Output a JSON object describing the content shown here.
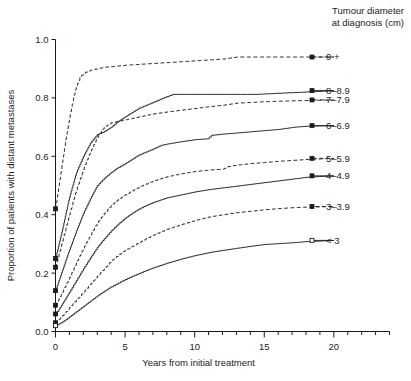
{
  "chart_data": {
    "type": "line",
    "title": "",
    "xlabel": "Years from initial treatment",
    "ylabel": "Proportion of patients with distant metastases",
    "xlim": [
      0,
      24
    ],
    "ylim": [
      0.0,
      1.0
    ],
    "grid": false,
    "legend_position": "right",
    "legend_title": "Tumour diameter at diagnosis (cm)",
    "legend_title_line1": "Tumour diameter",
    "legend_title_line2": "at diagnosis (cm)",
    "x_ticks": [
      0,
      5,
      10,
      15,
      20
    ],
    "x_tick_labels": [
      "0",
      "5",
      "10",
      "15",
      "20"
    ],
    "x_minor_tick_step": 1,
    "y_ticks": [
      0.0,
      0.2,
      0.4,
      0.6,
      0.8,
      1.0
    ],
    "y_tick_labels": [
      "0.0",
      "0.2",
      "0.4",
      "0.6",
      "0.8",
      "1.0"
    ],
    "series": [
      {
        "name": "9 +",
        "label": "9 +",
        "style": "dashed",
        "marker": "filled-square",
        "start_value": 0.42,
        "end_value": 0.94,
        "x": [
          0,
          0.25,
          0.5,
          0.75,
          1.0,
          1.25,
          1.5,
          1.75,
          2.0,
          2.5,
          3.0,
          3.5,
          4.0,
          5.0,
          6.0,
          7.0,
          8.0,
          9.0,
          10.0,
          11.0,
          12.0,
          13.0,
          15.0,
          17.0,
          20.0
        ],
        "values": [
          0.42,
          0.5,
          0.58,
          0.66,
          0.73,
          0.79,
          0.84,
          0.87,
          0.885,
          0.895,
          0.9,
          0.905,
          0.907,
          0.912,
          0.915,
          0.918,
          0.921,
          0.924,
          0.927,
          0.93,
          0.933,
          0.94,
          0.94,
          0.94,
          0.94
        ]
      },
      {
        "name": "8-8.9",
        "label": "8–8.9",
        "style": "solid",
        "marker": "filled-square",
        "start_value": 0.25,
        "end_value": 0.825,
        "x": [
          0,
          0.25,
          0.5,
          0.75,
          1.0,
          1.5,
          2.0,
          2.5,
          3.0,
          3.5,
          4.0,
          4.5,
          5.0,
          5.5,
          6.0,
          6.5,
          7.0,
          7.5,
          8.0,
          8.4,
          14.2,
          20.0
        ],
        "values": [
          0.25,
          0.3,
          0.35,
          0.405,
          0.46,
          0.545,
          0.6,
          0.645,
          0.675,
          0.685,
          0.7,
          0.72,
          0.735,
          0.75,
          0.765,
          0.775,
          0.785,
          0.795,
          0.805,
          0.812,
          0.812,
          0.825
        ]
      },
      {
        "name": "7-7.9",
        "label": "7–7.9",
        "style": "dashed",
        "marker": "filled-square",
        "start_value": 0.22,
        "end_value": 0.793,
        "x": [
          0,
          0.25,
          0.5,
          0.75,
          1.0,
          1.5,
          2.0,
          2.5,
          3.0,
          3.5,
          4.0,
          5.0,
          6.0,
          7.0,
          8.0,
          9.0,
          10.0,
          11.0,
          12.0,
          13.0,
          15.0,
          17.0,
          20.0
        ],
        "values": [
          0.22,
          0.265,
          0.31,
          0.355,
          0.4,
          0.485,
          0.555,
          0.615,
          0.665,
          0.7,
          0.715,
          0.725,
          0.735,
          0.745,
          0.752,
          0.758,
          0.764,
          0.77,
          0.775,
          0.782,
          0.787,
          0.79,
          0.793
        ]
      },
      {
        "name": "6-6.9",
        "label": "6–6.9",
        "style": "solid",
        "marker": "filled-square",
        "start_value": 0.14,
        "end_value": 0.705,
        "x": [
          0,
          0.25,
          0.5,
          0.75,
          1.0,
          1.5,
          2.0,
          2.5,
          3.0,
          3.5,
          4.0,
          4.5,
          5.0,
          5.5,
          6.0,
          6.5,
          7.0,
          7.6,
          8.0,
          9.0,
          10.0,
          10.9,
          11.2,
          12.0,
          13.0,
          14.0,
          15.0,
          16.0,
          17.2,
          18.0,
          20.0
        ],
        "values": [
          0.14,
          0.175,
          0.21,
          0.245,
          0.28,
          0.345,
          0.405,
          0.455,
          0.5,
          0.525,
          0.545,
          0.562,
          0.575,
          0.59,
          0.605,
          0.615,
          0.625,
          0.638,
          0.642,
          0.65,
          0.657,
          0.66,
          0.672,
          0.676,
          0.68,
          0.684,
          0.688,
          0.692,
          0.7,
          0.703,
          0.705
        ]
      },
      {
        "name": "5-5.9",
        "label": "5–5.9",
        "style": "dashed",
        "marker": "filled-square",
        "start_value": 0.09,
        "end_value": 0.593,
        "x": [
          0,
          0.25,
          0.5,
          0.75,
          1.0,
          1.5,
          2.0,
          2.5,
          3.0,
          3.5,
          4.0,
          4.5,
          5.0,
          5.5,
          6.0,
          6.5,
          7.0,
          8.0,
          9.0,
          10.0,
          11.0,
          12.0,
          12.4,
          13.0,
          14.0,
          15.0,
          16.0,
          17.0,
          18.0,
          19.0,
          20.0
        ],
        "values": [
          0.09,
          0.112,
          0.135,
          0.16,
          0.185,
          0.235,
          0.285,
          0.33,
          0.372,
          0.405,
          0.432,
          0.452,
          0.468,
          0.482,
          0.495,
          0.505,
          0.515,
          0.53,
          0.54,
          0.548,
          0.553,
          0.556,
          0.565,
          0.57,
          0.575,
          0.579,
          0.583,
          0.586,
          0.589,
          0.591,
          0.593
        ]
      },
      {
        "name": "4-4.9",
        "label": "4–4.9",
        "style": "solid",
        "marker": "filled-square",
        "start_value": 0.06,
        "end_value": 0.533,
        "x": [
          0,
          0.25,
          0.5,
          0.75,
          1.0,
          1.5,
          2.0,
          2.5,
          3.0,
          3.5,
          4.0,
          4.5,
          5.0,
          5.5,
          6.0,
          6.5,
          7.0,
          8.0,
          9.0,
          10.0,
          11.0,
          12.0,
          13.0,
          14.0,
          15.0,
          16.0,
          17.0,
          18.0,
          19.0,
          20.0
        ],
        "values": [
          0.06,
          0.077,
          0.095,
          0.115,
          0.135,
          0.175,
          0.215,
          0.252,
          0.288,
          0.318,
          0.345,
          0.368,
          0.388,
          0.405,
          0.42,
          0.432,
          0.442,
          0.458,
          0.468,
          0.478,
          0.486,
          0.492,
          0.498,
          0.504,
          0.51,
          0.516,
          0.522,
          0.528,
          0.531,
          0.533
        ]
      },
      {
        "name": "3-3.9",
        "label": "3–3.9",
        "style": "dashed",
        "marker": "filled-square",
        "start_value": 0.03,
        "end_value": 0.428,
        "x": [
          0,
          0.25,
          0.5,
          0.75,
          1.0,
          1.5,
          2.0,
          2.5,
          3.0,
          3.5,
          4.0,
          4.5,
          5.0,
          5.5,
          6.0,
          6.5,
          7.0,
          8.0,
          9.0,
          10.0,
          11.0,
          12.0,
          13.0,
          14.0,
          15.0,
          16.0,
          17.0,
          18.0,
          19.0,
          20.0
        ],
        "values": [
          0.03,
          0.042,
          0.055,
          0.068,
          0.082,
          0.108,
          0.135,
          0.162,
          0.19,
          0.215,
          0.242,
          0.262,
          0.278,
          0.292,
          0.305,
          0.318,
          0.33,
          0.35,
          0.366,
          0.38,
          0.392,
          0.4,
          0.407,
          0.412,
          0.417,
          0.421,
          0.424,
          0.426,
          0.427,
          0.428
        ]
      },
      {
        "name": "< 3",
        "label": "< 3",
        "style": "solid",
        "marker": "open-square",
        "start_value": 0.02,
        "end_value": 0.312,
        "x": [
          0,
          0.25,
          0.5,
          0.75,
          1.0,
          1.5,
          2.0,
          2.5,
          3.0,
          3.5,
          4.0,
          4.5,
          5.0,
          5.5,
          6.0,
          6.5,
          7.0,
          8.0,
          9.0,
          10.0,
          11.0,
          12.0,
          13.0,
          14.0,
          15.0,
          16.0,
          17.0,
          18.0,
          19.0,
          20.0
        ],
        "values": [
          0.02,
          0.026,
          0.033,
          0.041,
          0.05,
          0.068,
          0.086,
          0.104,
          0.122,
          0.138,
          0.153,
          0.166,
          0.178,
          0.189,
          0.199,
          0.209,
          0.218,
          0.234,
          0.248,
          0.26,
          0.27,
          0.278,
          0.285,
          0.292,
          0.298,
          0.301,
          0.304,
          0.308,
          0.31,
          0.312
        ]
      }
    ],
    "colors": {
      "ink": "#1b1b1b",
      "background": "#ffffff"
    }
  }
}
